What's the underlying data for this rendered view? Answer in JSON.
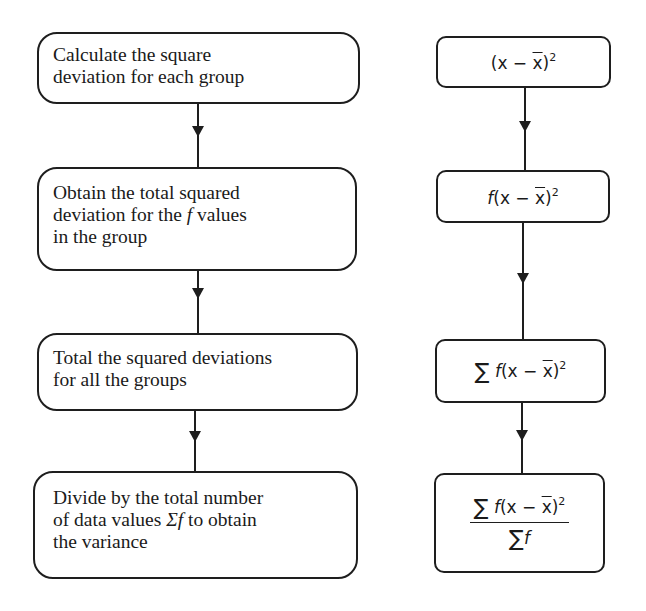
{
  "left_column": {
    "steps": [
      {
        "id": 1,
        "lines": [
          "Calculate the square",
          "deviation for each group"
        ]
      },
      {
        "id": 2,
        "lines": [
          "Obtain the total squared",
          "deviation for the ",
          "f",
          " values",
          "in the group"
        ]
      },
      {
        "id": 3,
        "lines": [
          "Total the squared deviations",
          "for all the groups"
        ]
      },
      {
        "id": 4,
        "lines": [
          "Divide by the total number",
          "of data values ",
          "Σf",
          " to obtain",
          "the variance"
        ]
      }
    ]
  },
  "right_column": {
    "formulas": [
      {
        "id": 1,
        "text": "(x − x̄)²",
        "open": "(x − ",
        "xbar": "x",
        "close": ")",
        "exp": "2"
      },
      {
        "id": 2,
        "text": "f(x − x̄)²",
        "prefix": "f",
        "open": "(x − ",
        "xbar": "x",
        "close": ")",
        "exp": "2"
      },
      {
        "id": 3,
        "text": "∑ f(x − x̄)²",
        "sigma": "∑",
        "prefix": "f",
        "open": "(x − ",
        "xbar": "x",
        "close": ")",
        "exp": "2"
      },
      {
        "id": 4,
        "text": "∑ f(x − x̄)² / ∑ f",
        "sigma": "∑",
        "prefix": "f",
        "open": "(x − ",
        "xbar": "x",
        "close": ")",
        "exp": "2",
        "den_sigma": "∑",
        "den_f": "f"
      }
    ]
  },
  "colors": {
    "stroke": "#1e1e1e",
    "background": "#ffffff",
    "text": "#1a1a1a"
  }
}
